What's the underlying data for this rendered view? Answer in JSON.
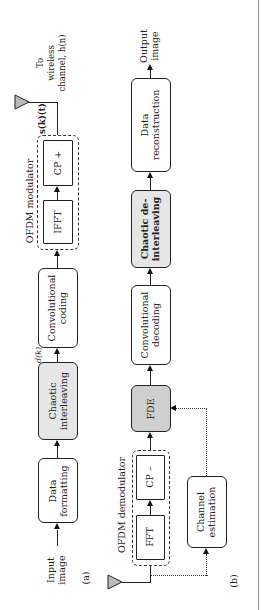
{
  "panel_a": {
    "tag": "(a)",
    "input": "Input\nimage",
    "data_formatting": "Data\nformatting",
    "chaotic_interleaving": "Chaotic\ninterleaving",
    "signal_d": "d(k)",
    "convolutional_coding": "Convolutional\ncoding",
    "ofdm_modulator_label": "OFDM modulator",
    "ifft": "IFFT",
    "cp_plus": "CP +",
    "signal_s": "s(k)(t)",
    "to_channel": "To\nwireless\nchannel, h(n)"
  },
  "panel_b": {
    "tag": "(b)",
    "ofdm_demodulator_label": "OFDM demodulator",
    "fft": "FFT",
    "cp_minus": "CP –",
    "channel_estimation": "Channel\nestimation",
    "fde": "FDE",
    "convolutional_decoding": "Convolutional\ndecoding",
    "chaotic_deinterleaving": "Chaotic de-\ninterleaving",
    "data_reconstruction": "Data\nreconstruction",
    "output": "Output\nimage"
  },
  "colors": {
    "gray_block": "#e6e6e6",
    "dark_block": "#cfcfcf",
    "line": "#222222"
  }
}
